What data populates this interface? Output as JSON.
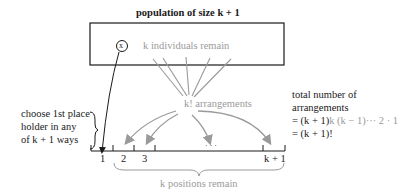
{
  "title": "population of size k + 1",
  "box": {
    "element_label": "x",
    "remain_label": "k individuals remain"
  },
  "fan_label": "k! arrangements",
  "left_note": {
    "lines": [
      "choose 1st place",
      "holder in any",
      "of k + 1 ways"
    ]
  },
  "positions": {
    "labels": [
      "1",
      "2",
      "3",
      "k + 1"
    ],
    "ellipsis": "· · ·",
    "brace_label": "k positions remain"
  },
  "right_note": {
    "lines": [
      "total number of",
      "arrangements"
    ],
    "formula_line1_prefix": "= (k + 1)",
    "formula_line1_suffix": "k (k − 1)··· 2 · 1",
    "formula_line2": "= (k + 1)!"
  },
  "colors": {
    "dark": "#1a1a1a",
    "gray": "#9a9a9a"
  }
}
